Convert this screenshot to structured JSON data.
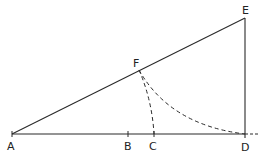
{
  "diagram": {
    "type": "geometric-construction",
    "stroke_color": "#2a2a2a",
    "points": {
      "A": {
        "label": "A",
        "x": 12,
        "y": 134
      },
      "B": {
        "label": "B",
        "x": 128,
        "y": 134
      },
      "C": {
        "label": "C",
        "x": 154,
        "y": 134
      },
      "D": {
        "label": "D",
        "x": 245,
        "y": 134
      },
      "E": {
        "label": "E",
        "x": 245,
        "y": 18
      },
      "F": {
        "label": "F",
        "x": 139,
        "y": 70
      }
    },
    "segments": [
      {
        "from": "A",
        "to": "D",
        "style": "solid"
      },
      {
        "from": "A",
        "to": "E",
        "style": "solid"
      },
      {
        "from": "D",
        "to": "E",
        "style": "solid"
      }
    ],
    "arcs": [
      {
        "from": "F",
        "to": "C",
        "style": "dashed"
      },
      {
        "from": "F",
        "to": "D",
        "style": "dashed"
      }
    ],
    "extension": {
      "from": "D",
      "style": "dashed"
    }
  }
}
